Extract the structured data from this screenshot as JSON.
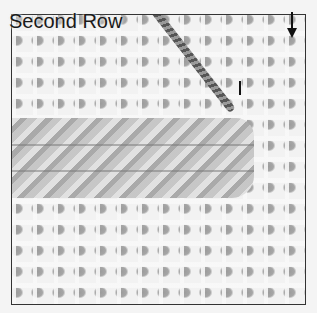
{
  "illustration": {
    "title": "Second Row",
    "direction_indicator": "down-arrow-icon",
    "subject": "needlepoint canvas with stitched band",
    "colors": {
      "border": "#333333",
      "canvas_background": "#f2f2f2",
      "canvas_holes": "#a0a0a0",
      "stitch_band": "#bdbdbd",
      "yarn": "#666666",
      "text": "#1a1a1a"
    }
  }
}
